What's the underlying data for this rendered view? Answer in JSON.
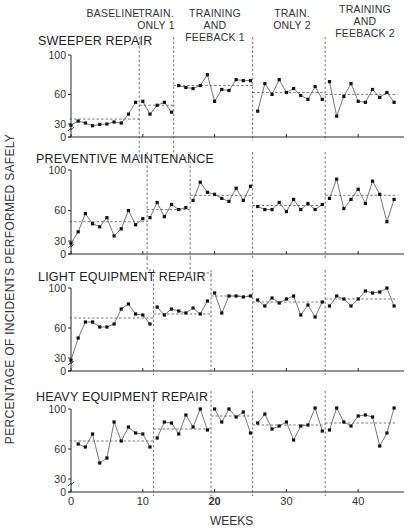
{
  "chart_data": {
    "type": "line",
    "title": "",
    "xlabel": "WEEKS",
    "ylabel": "PERCENTAGE OF INCIDENTS PERFORMED SAFELY",
    "x_ticks": [
      0,
      10,
      20,
      30,
      40
    ],
    "y_ticks": [
      0,
      30,
      60,
      100
    ],
    "xlim": [
      0,
      46
    ],
    "ylim": [
      0,
      100
    ],
    "grid": false,
    "phase_labels": [
      {
        "text": "BASELINE",
        "lines": [
          "BASELINE"
        ]
      },
      {
        "text": "TRAIN. ONLY 1",
        "lines": [
          "TRAIN.",
          "ONLY 1"
        ]
      },
      {
        "text": "TRAINING AND FEEBACK 1",
        "lines": [
          "TRAINING",
          "AND",
          "FEEBACK 1"
        ]
      },
      {
        "text": "TRAIN. ONLY 2",
        "lines": [
          "TRAIN.",
          "ONLY 2"
        ]
      },
      {
        "text": "TRAINING AND FEEBACK 2",
        "lines": [
          "TRAINING",
          "AND",
          "FEEBACK 2"
        ]
      }
    ],
    "panels": [
      {
        "name": "SWEEPER REPAIR",
        "phase_boundaries": [
          9.5,
          14.3,
          25.3,
          35.4
        ],
        "phase_means": [
          35,
          49,
          69,
          62,
          60
        ],
        "series": [
          {
            "phase": "BASELINE",
            "x": [
              0,
              1,
              2,
              3,
              4,
              5,
              6,
              7,
              8,
              9
            ],
            "values": [
              27,
              33,
              31,
              26,
              29,
              30,
              32,
              31,
              40,
              52
            ]
          },
          {
            "phase": "TRAIN. ONLY 1",
            "x": [
              10,
              11,
              12,
              13,
              14
            ],
            "values": [
              53,
              40,
              49,
              52,
              42
            ]
          },
          {
            "phase": "TRAINING AND FEEBACK 1",
            "x": [
              15,
              16,
              17,
              18,
              19,
              20,
              21,
              22,
              23,
              24,
              25
            ],
            "values": [
              69,
              67,
              66,
              69,
              80,
              53,
              65,
              64,
              75,
              74,
              74
            ]
          },
          {
            "phase": "TRAIN. ONLY 2",
            "x": [
              26,
              27,
              28,
              29,
              30,
              31,
              32,
              33,
              34,
              35
            ],
            "values": [
              43,
              71,
              60,
              75,
              62,
              66,
              59,
              55,
              68,
              55
            ]
          },
          {
            "phase": "TRAINING AND FEEBACK 2",
            "x": [
              36,
              37,
              38,
              39,
              40,
              41,
              42,
              43,
              44,
              45
            ],
            "values": [
              73,
              38,
              58,
              71,
              53,
              52,
              65,
              57,
              62,
              52
            ]
          }
        ]
      },
      {
        "name": "PREVENTIVE MAINTENANCE",
        "phase_boundaries": [
          10.6,
          16.6,
          25.3,
          35.4
        ],
        "phase_means": [
          49,
          61,
          75,
          65,
          75
        ],
        "series": [
          {
            "phase": "BASELINE",
            "x": [
              0,
              1,
              2,
              3,
              4,
              5,
              6,
              7,
              8,
              9,
              10
            ],
            "values": [
              25,
              39,
              57,
              47,
              44,
              53,
              35,
              42,
              60,
              46,
              52
            ]
          },
          {
            "phase": "TRAIN. ONLY 1",
            "x": [
              11,
              12,
              13,
              14,
              15,
              16
            ],
            "values": [
              53,
              68,
              54,
              66,
              61,
              63
            ]
          },
          {
            "phase": "TRAINING AND FEEBACK 1",
            "x": [
              17,
              18,
              19,
              20,
              21,
              22,
              23,
              24,
              25
            ],
            "values": [
              70,
              88,
              78,
              76,
              72,
              69,
              82,
              70,
              84
            ]
          },
          {
            "phase": "TRAIN. ONLY 2",
            "x": [
              26,
              27,
              28,
              29,
              30,
              31,
              32,
              33,
              34,
              35
            ],
            "values": [
              64,
              61,
              61,
              68,
              59,
              71,
              61,
              67,
              61,
              66
            ]
          },
          {
            "phase": "TRAINING AND FEEBACK 2",
            "x": [
              36,
              37,
              38,
              39,
              40,
              41,
              42,
              43,
              44,
              45
            ],
            "values": [
              72,
              91,
              62,
              71,
              81,
              67,
              89,
              76,
              49,
              71
            ]
          }
        ]
      },
      {
        "name": "LIGHT EQUIPMENT REPAIR",
        "phase_boundaries": [
          11.5,
          19.5,
          25.3,
          35.4
        ],
        "phase_means": [
          70,
          74,
          92,
          86,
          89
        ],
        "series": [
          {
            "phase": "BASELINE",
            "x": [
              0,
              1,
              2,
              3,
              4,
              5,
              6,
              7,
              8,
              9,
              10,
              11
            ],
            "values": [
              25,
              50,
              66,
              66,
              61,
              61,
              64,
              79,
              84,
              74,
              73,
              64
            ]
          },
          {
            "phase": "TRAIN. ONLY 1",
            "x": [
              12,
              13,
              14,
              15,
              16,
              17,
              18,
              19
            ],
            "values": [
              81,
              73,
              79,
              77,
              75,
              80,
              74,
              87
            ]
          },
          {
            "phase": "TRAINING AND FEEBACK 1",
            "x": [
              20,
              21,
              22,
              23,
              24,
              25
            ],
            "values": [
              95,
              75,
              92,
              92,
              91,
              92
            ]
          },
          {
            "phase": "TRAIN. ONLY 2",
            "x": [
              26,
              27,
              28,
              29,
              30,
              31,
              32,
              33,
              34,
              35
            ],
            "values": [
              88,
              82,
              90,
              85,
              89,
              92,
              73,
              83,
              71,
              86
            ]
          },
          {
            "phase": "TRAINING AND FEEBACK 2",
            "x": [
              36,
              37,
              38,
              39,
              40,
              41,
              42,
              43,
              44,
              45
            ],
            "values": [
              82,
              92,
              89,
              82,
              89,
              97,
              95,
              96,
              100,
              82
            ]
          }
        ]
      },
      {
        "name": "HEAVY EQUIPMENT REPAIR",
        "phase_boundaries": [
          11.5,
          19.5,
          25.3,
          35.4
        ],
        "phase_means": [
          68,
          80,
          93,
          84,
          86
        ],
        "series": [
          {
            "phase": "BASELINE",
            "x": [
              1,
              2,
              3,
              4,
              5,
              6,
              7,
              8,
              9,
              10,
              11
            ],
            "values": [
              65,
              62,
              75,
              46,
              51,
              87,
              68,
              82,
              76,
              75,
              62
            ]
          },
          {
            "phase": "TRAIN. ONLY 1",
            "x": [
              12,
              13,
              14,
              15,
              16,
              17,
              18,
              19
            ],
            "values": [
              71,
              87,
              86,
              75,
              94,
              82,
              100,
              79
            ]
          },
          {
            "phase": "TRAINING AND FEEBACK 1",
            "x": [
              20,
              21,
              22,
              23,
              24,
              25
            ],
            "values": [
              100,
              87,
              100,
              92,
              97,
              76
            ]
          },
          {
            "phase": "TRAIN. ONLY 2",
            "x": [
              26,
              27,
              28,
              29,
              30,
              31,
              32,
              33,
              34,
              35
            ],
            "values": [
              86,
              95,
              80,
              83,
              87,
              69,
              83,
              84,
              101,
              78
            ]
          },
          {
            "phase": "TRAINING AND FEEBACK 2",
            "x": [
              36,
              37,
              38,
              39,
              40,
              41,
              42,
              43,
              44,
              45
            ],
            "values": [
              79,
              101,
              87,
              83,
              93,
              94,
              92,
              63,
              76,
              101
            ]
          }
        ]
      }
    ]
  },
  "labels": {
    "xlabel": "WEEKS",
    "ylabel": "PERCENTAGE OF INCIDENTS PERFORMED SAFELY",
    "phase_0_l0": "BASELINE",
    "phase_1_l0": "TRAIN.",
    "phase_1_l1": "ONLY 1",
    "phase_2_l0": "TRAINING",
    "phase_2_l1": "AND",
    "phase_2_l2": "FEEBACK 1",
    "phase_3_l0": "TRAIN.",
    "phase_3_l1": "ONLY 2",
    "phase_4_l0": "TRAINING",
    "phase_4_l1": "AND",
    "phase_4_l2": "FEEBACK 2",
    "panel_0": "SWEEPER REPAIR",
    "panel_1": "PREVENTIVE MAINTENANCE",
    "panel_2": "LIGHT EQUIPMENT REPAIR",
    "panel_3": "HEAVY EQUIPMENT REPAIR"
  }
}
